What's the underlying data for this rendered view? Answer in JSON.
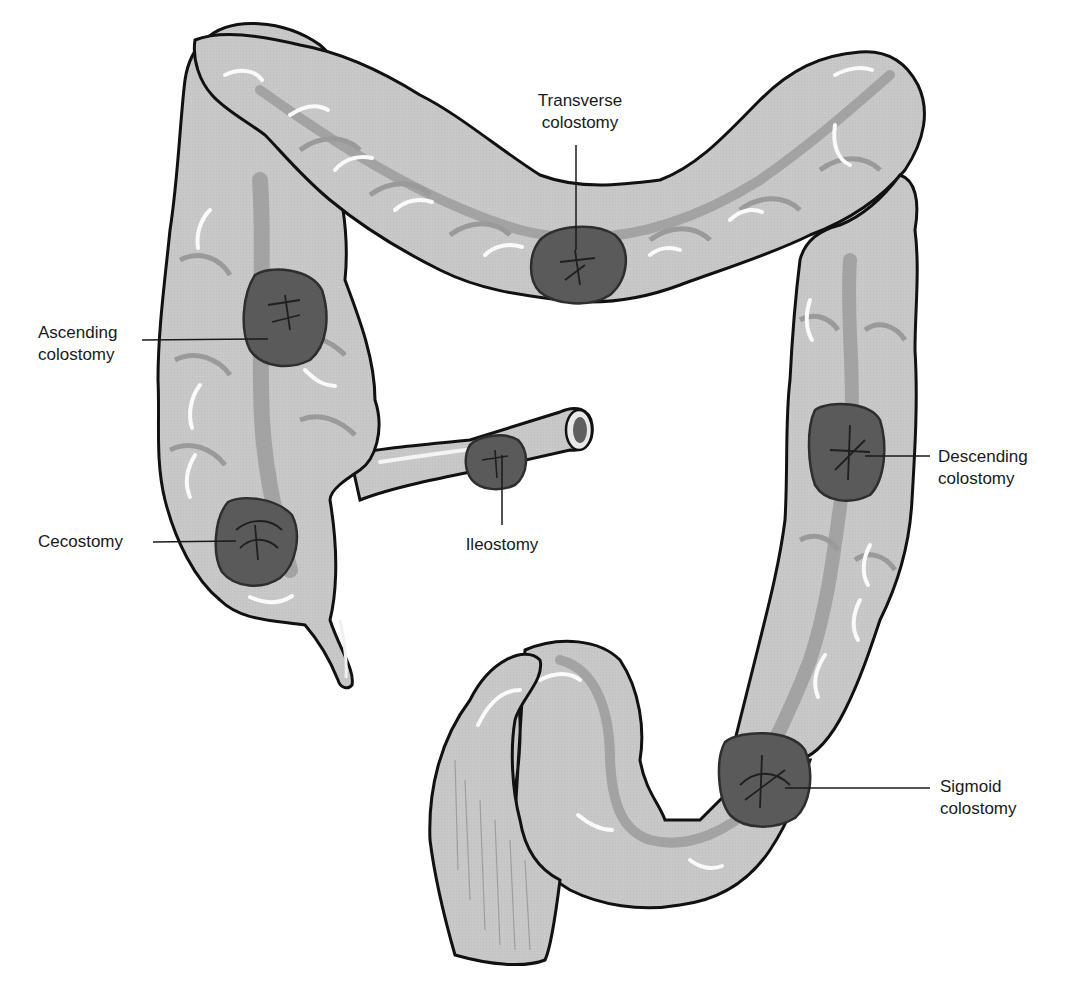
{
  "diagram": {
    "colors": {
      "colon_fill": "#c9c9c9",
      "colon_shadow": "#9a9a9a",
      "colon_highlight": "#f4f4f4",
      "outline": "#111111",
      "stoma_fill": "#5a5a5a",
      "stoma_dark": "#2e2e2e",
      "label_text": "#1a1a1a",
      "background": "#ffffff"
    },
    "labels": [
      {
        "id": "transverse",
        "line1": "Transverse",
        "line2": "colostomy"
      },
      {
        "id": "ascending",
        "line1": "Ascending",
        "line2": "colostomy"
      },
      {
        "id": "cecostomy",
        "line1": "Cecostomy",
        "line2": ""
      },
      {
        "id": "ileostomy",
        "line1": "Ileostomy",
        "line2": ""
      },
      {
        "id": "descending",
        "line1": "Descending",
        "line2": "colostomy"
      },
      {
        "id": "sigmoid",
        "line1": "Sigmoid",
        "line2": "colostomy"
      }
    ],
    "structures": [
      "ascending-colon",
      "transverse-colon",
      "descending-colon",
      "sigmoid-colon",
      "rectum",
      "cecum",
      "appendix",
      "ileum"
    ]
  }
}
